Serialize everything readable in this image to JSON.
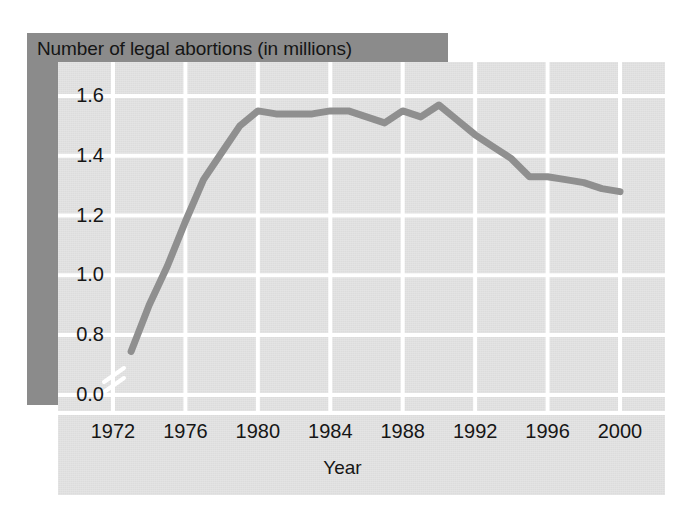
{
  "figure": {
    "title": "Number of legal abortions (in millions)",
    "colors": {
      "banner": "#8b8b8b",
      "card": "#e2e2e2",
      "gridline": "#ffffff",
      "line": "#8f8f8f",
      "text": "#161616",
      "page": "#ffffff"
    }
  },
  "chart_data": {
    "type": "line",
    "title": "Number of legal abortions (in millions)",
    "xlabel": "Year",
    "ylabel": "Number of legal abortions (in millions)",
    "xlim": [
      1972,
      2000
    ],
    "ylim": [
      0.7,
      1.7
    ],
    "grid": true,
    "legend": "none",
    "axis_break": true,
    "axis_break_note": "y-axis broken between 0.0 and 0.7",
    "xticks": [
      1972,
      1976,
      1980,
      1984,
      1988,
      1992,
      1996,
      2000
    ],
    "xtick_labels": [
      "1972",
      "1976",
      "1980",
      "1984",
      "1988",
      "1992",
      "1996",
      "2000"
    ],
    "yticks": [
      0.0,
      0.8,
      1.0,
      1.2,
      1.4,
      1.6
    ],
    "ytick_labels": [
      "0.0",
      "0.8",
      "1.0",
      "1.2",
      "1.4",
      "1.6"
    ],
    "x": [
      1973,
      1974,
      1975,
      1976,
      1977,
      1978,
      1979,
      1980,
      1981,
      1982,
      1983,
      1984,
      1985,
      1986,
      1987,
      1988,
      1989,
      1990,
      1991,
      1992,
      1993,
      1994,
      1995,
      1996,
      1997,
      1998,
      1999,
      2000
    ],
    "values": [
      0.745,
      0.9,
      1.03,
      1.18,
      1.32,
      1.41,
      1.5,
      1.55,
      1.54,
      1.54,
      1.54,
      1.55,
      1.55,
      1.53,
      1.51,
      1.55,
      1.53,
      1.57,
      1.52,
      1.47,
      1.43,
      1.39,
      1.33,
      1.33,
      1.32,
      1.31,
      1.29,
      1.28
    ],
    "series": [
      {
        "name": "Number of legal abortions (in millions)",
        "values": [
          0.745,
          0.9,
          1.03,
          1.18,
          1.32,
          1.41,
          1.5,
          1.55,
          1.54,
          1.54,
          1.54,
          1.55,
          1.55,
          1.53,
          1.51,
          1.55,
          1.53,
          1.57,
          1.52,
          1.47,
          1.43,
          1.39,
          1.33,
          1.33,
          1.32,
          1.31,
          1.29,
          1.28
        ]
      }
    ]
  }
}
